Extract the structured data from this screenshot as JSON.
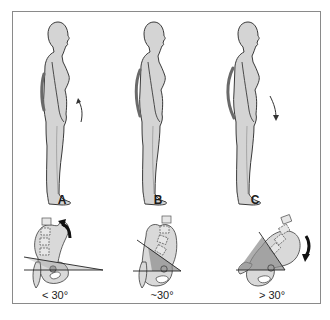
{
  "figure": {
    "panels": [
      {
        "id": "A",
        "label": "A",
        "angle_label": "< 30°",
        "pelvic_rotation": "posterior",
        "arrow_direction": "up"
      },
      {
        "id": "B",
        "label": "B",
        "angle_label": "~30°",
        "pelvic_rotation": "neutral",
        "arrow_direction": "none"
      },
      {
        "id": "C",
        "label": "C",
        "angle_label": "> 30°",
        "pelvic_rotation": "anterior",
        "arrow_direction": "down"
      }
    ]
  },
  "colors": {
    "body_fill": "#d4d4d4",
    "outline": "#3a3a3a",
    "spine_curve": "#6a6a6a",
    "pelvis_fill": "#d9d9d9",
    "wedge_fill": "#8c8c8c",
    "frame": "#8a8a8a"
  }
}
